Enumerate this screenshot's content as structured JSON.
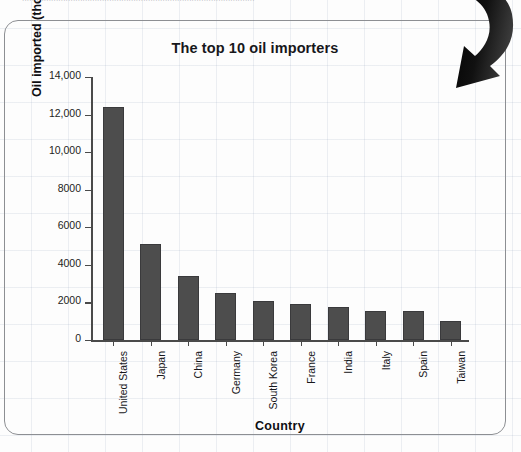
{
  "page": {
    "top_cut_text": "................................................................................................"
  },
  "chart_panel": {
    "title": "The top 10 oil importers",
    "x_axis_title": "Country",
    "y_axis_title": "Oil imported (thousand barrels per day)",
    "bar_color": "#4d4d4d",
    "axis_color": "#4a4a4a",
    "panel_border_color": "#8d8f93"
  },
  "arrow": {
    "name": "curved-down-arrow",
    "color": "#000000"
  },
  "chart_data": {
    "type": "bar",
    "title": "The top 10 oil importers",
    "xlabel": "Country",
    "ylabel": "Oil imported (thousand barrels per day)",
    "categories": [
      "United States",
      "Japan",
      "China",
      "Germany",
      "South Korea",
      "France",
      "India",
      "Italy",
      "Spain",
      "Taiwan"
    ],
    "values": [
      12400,
      5100,
      3400,
      2500,
      2100,
      1900,
      1750,
      1550,
      1550,
      1000
    ],
    "ylim": [
      0,
      14000
    ],
    "yticks": [
      0,
      2000,
      4000,
      6000,
      8000,
      10000,
      12000,
      14000
    ],
    "ytick_labels": [
      "0",
      "2000",
      "4000",
      "6000",
      "8000",
      "10,000",
      "12,000",
      "14,000"
    ],
    "grid": false,
    "legend": false
  }
}
